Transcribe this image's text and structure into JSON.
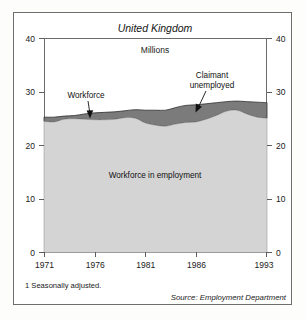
{
  "figure": {
    "title": "United Kingdom",
    "unit_label": "Millions",
    "footnote": "1 Seasonally adjusted.",
    "source": "Source: Employment Department"
  },
  "annotations": {
    "workforce": "Workforce",
    "claimant_line1": "Claimant",
    "claimant_line2": "unemployed",
    "employment_band": "Workforce in employment"
  },
  "colors": {
    "employed_fill": "#d4d4d4",
    "unemployed_fill": "#7b7b7b",
    "axis": "#6b6b6b",
    "frame": "#6e6e6e",
    "text": "#141414"
  },
  "chart_data": {
    "type": "area",
    "title": "United Kingdom",
    "subtitle": "Millions",
    "xlabel": "",
    "ylabel": "Millions",
    "ylim": [
      0,
      40
    ],
    "xlim": [
      1971,
      1993
    ],
    "grid": false,
    "legend": "annotated-inline",
    "stacked": true,
    "y_ticks": [
      0,
      10,
      20,
      30,
      40
    ],
    "y_ticks_right": [
      0,
      10,
      20,
      30,
      40
    ],
    "x_ticks": [
      1971,
      1976,
      1981,
      1986,
      1993
    ],
    "x_tick_labels": [
      "1971",
      "1976",
      "1981",
      "1986",
      "1993"
    ],
    "x": [
      1971,
      1972,
      1973,
      1974,
      1975,
      1976,
      1977,
      1978,
      1979,
      1980,
      1981,
      1982,
      1983,
      1984,
      1985,
      1986,
      1987,
      1988,
      1989,
      1990,
      1991,
      1992,
      1993
    ],
    "series": [
      {
        "name": "Workforce in employment",
        "values": [
          24.5,
          24.4,
          24.9,
          25.0,
          24.9,
          24.8,
          24.8,
          24.9,
          25.2,
          25.1,
          24.2,
          23.8,
          23.6,
          24.0,
          24.3,
          24.4,
          24.9,
          25.6,
          26.4,
          26.6,
          25.9,
          25.3,
          25.1
        ]
      },
      {
        "name": "Claimant unemployed",
        "values": [
          0.8,
          0.9,
          0.6,
          0.6,
          1.0,
          1.3,
          1.4,
          1.4,
          1.3,
          1.6,
          2.4,
          2.8,
          3.0,
          3.1,
          3.2,
          3.2,
          2.9,
          2.4,
          1.8,
          1.7,
          2.3,
          2.8,
          2.9
        ]
      }
    ],
    "total_workforce": [
      25.3,
      25.3,
      25.5,
      25.6,
      25.9,
      26.1,
      26.2,
      26.3,
      26.5,
      26.7,
      26.6,
      26.6,
      26.6,
      27.1,
      27.5,
      27.6,
      27.8,
      28.0,
      28.2,
      28.3,
      28.2,
      28.1,
      28.0
    ]
  }
}
